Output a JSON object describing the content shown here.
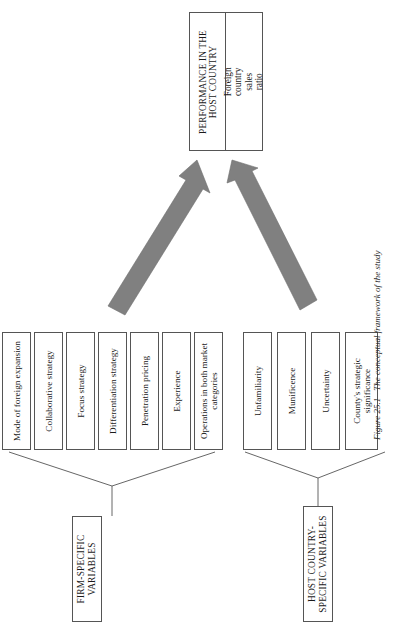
{
  "figure": {
    "caption_number": "Figure 25.1",
    "caption_text": "The conceptual framework of the study",
    "orientation": "rotated-90-ccw",
    "arrow_color": "#808080",
    "box_border_color": "#555555",
    "background_color": "#ffffff"
  },
  "outcome": {
    "title": "PERFORMANCE IN THE HOST COUNTRY",
    "measure": "Foreign country sales ratio"
  },
  "groups": [
    {
      "id": "firm",
      "label": "FIRM-SPECIFIC VARIABLES",
      "variables": [
        {
          "label": "Mode of foreign expansion"
        },
        {
          "label": "Collaborative strategy"
        },
        {
          "label": "Focus strategy"
        },
        {
          "label": "Differentiation strategy"
        },
        {
          "label": "Penetration pricing"
        },
        {
          "label": "Experience"
        },
        {
          "label": "Operations in both market categories"
        }
      ]
    },
    {
      "id": "host",
      "label": "HOST COUNTRY-SPECIFIC VARIABLES",
      "variables": [
        {
          "label": "Unfamiliarity"
        },
        {
          "label": "Munificence"
        },
        {
          "label": "Uncertainty"
        },
        {
          "label": "County's strategic significance"
        }
      ]
    }
  ],
  "arrows": [
    {
      "from": "firm",
      "to": "outcome",
      "style": "thick-block-arrow"
    },
    {
      "from": "host",
      "to": "outcome",
      "style": "thick-block-arrow"
    }
  ]
}
